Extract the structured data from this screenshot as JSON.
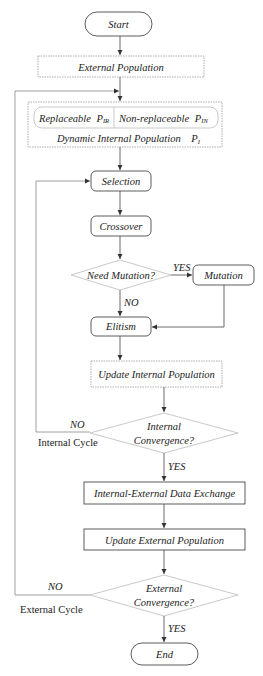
{
  "nodes": {
    "start": {
      "label": "Start"
    },
    "external_population": {
      "label": "External Population"
    },
    "internal_population": {
      "replaceable_label": "Replaceable",
      "replaceable_symbol": "P",
      "replaceable_sub": "IR",
      "non_replaceable_label": "Non-replaceable",
      "non_replaceable_symbol": "P",
      "non_replaceable_sub": "IN",
      "dynamic_label": "Dynamic Internal Population",
      "dynamic_symbol": "P",
      "dynamic_sub": "I"
    },
    "selection": {
      "label": "Selection"
    },
    "crossover": {
      "label": "Crossover"
    },
    "need_mutation": {
      "label": "Need Mutation?"
    },
    "mutation": {
      "label": "Mutation"
    },
    "elitism": {
      "label": "Elitism"
    },
    "update_internal": {
      "label": "Update Internal Population"
    },
    "internal_convergence": {
      "line1": "Internal",
      "line2": "Convergence?"
    },
    "data_exchange": {
      "label": "Internal-External Data Exchange"
    },
    "update_external": {
      "label": "Update External Population"
    },
    "external_convergence": {
      "line1": "External",
      "line2": "Convergence?"
    },
    "end": {
      "label": "End"
    }
  },
  "edges": {
    "mutation_yes": "YES",
    "mutation_no": "NO",
    "internal_no": "NO",
    "internal_yes": "YES",
    "external_no": "NO",
    "external_yes": "YES"
  },
  "loops": {
    "internal_cycle": "Internal Cycle",
    "external_cycle": "External Cycle"
  }
}
